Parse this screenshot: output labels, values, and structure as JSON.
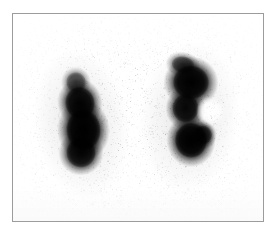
{
  "image": {
    "kind": "medical-scintigram",
    "modality": "nuclear-medicine-renal-scan",
    "view": "posterior",
    "title": "Renal scintigram",
    "width": 277,
    "height": 236,
    "background_color": "#ffffff",
    "frame": {
      "border_color": "#9c9c9c",
      "border_width": 1,
      "left": 12,
      "top": 13,
      "width": 252,
      "height": 209,
      "fill_color": "#ffffff"
    },
    "annotations": [],
    "labels": [],
    "scan": {
      "tracer_color": "#000000",
      "background_color": "#ffffff",
      "noise": {
        "description": "fine speckled counting grain across the whole field",
        "dot_count": 5200,
        "max_opacity": 0.42,
        "dot_size_min": 0.5,
        "dot_size_max": 1.45,
        "field_inset": 2
      },
      "midline_clearance": {
        "description": "lighter vertical band between the kidneys (spine/aorta region)",
        "center_x_fraction": 0.5,
        "half_width_fraction": 0.1
      },
      "regions": [
        {
          "name": "left-kidney",
          "side": "left",
          "description": "elongated oval of dense tracer uptake, upper pole tapered, lower pole rounded",
          "center_x_fraction": 0.275,
          "center_y_fraction": 0.53,
          "radius_x_fraction": 0.118,
          "radius_y_fraction": 0.225,
          "rotation_deg": -8,
          "intensity": 1.0,
          "halo_scale": 1.62,
          "blobs": [
            {
              "cx": 0.268,
              "cy": 0.43,
              "rx": 0.09,
              "ry": 0.12,
              "rot": -14,
              "intensity": 0.92
            },
            {
              "cx": 0.282,
              "cy": 0.56,
              "rx": 0.105,
              "ry": 0.15,
              "rot": -4,
              "intensity": 1.0
            },
            {
              "cx": 0.272,
              "cy": 0.67,
              "rx": 0.09,
              "ry": 0.11,
              "rot": 4,
              "intensity": 0.88
            },
            {
              "cx": 0.252,
              "cy": 0.33,
              "rx": 0.06,
              "ry": 0.075,
              "rot": -20,
              "intensity": 0.52
            }
          ]
        },
        {
          "name": "right-kidney",
          "side": "right",
          "description": "bean/C-shaped uptake, broad upper pole with a lateral notch at mid-height and a rounded lower pole",
          "center_x_fraction": 0.705,
          "center_y_fraction": 0.5,
          "radius_x_fraction": 0.125,
          "radius_y_fraction": 0.23,
          "rotation_deg": 6,
          "intensity": 1.0,
          "halo_scale": 1.6,
          "blobs": [
            {
              "cx": 0.712,
              "cy": 0.33,
              "rx": 0.11,
              "ry": 0.125,
              "rot": 6,
              "intensity": 0.98
            },
            {
              "cx": 0.69,
              "cy": 0.455,
              "rx": 0.08,
              "ry": 0.105,
              "rot": 0,
              "intensity": 0.86
            },
            {
              "cx": 0.712,
              "cy": 0.61,
              "rx": 0.098,
              "ry": 0.13,
              "rot": -4,
              "intensity": 1.0
            },
            {
              "cx": 0.76,
              "cy": 0.585,
              "rx": 0.055,
              "ry": 0.07,
              "rot": 0,
              "intensity": 0.7
            },
            {
              "cx": 0.68,
              "cy": 0.245,
              "rx": 0.07,
              "ry": 0.062,
              "rot": 10,
              "intensity": 0.58
            }
          ],
          "notch": {
            "description": "cortical indentation on the lateral border at mid-height",
            "cx": 0.79,
            "cy": 0.47,
            "rx": 0.058,
            "ry": 0.072
          }
        }
      ]
    }
  }
}
